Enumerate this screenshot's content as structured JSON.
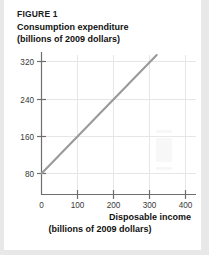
{
  "figure": {
    "label": "FIGURE 1",
    "title_line1": "Consumption expenditure",
    "title_line2": "(billions of 2009 dollars)",
    "xtitle_line1": "Disposable income",
    "xtitle_line2": "(billions of 2009 dollars)"
  },
  "colors": {
    "line": "#9a9a9a",
    "axis": "#6e6e6e",
    "grid": "#e3e3e3",
    "page": "#ffffff",
    "backdrop": "#e8e8e8",
    "text": "#111111"
  },
  "chart_data": {
    "type": "line",
    "title": "Consumption expenditure (billions of 2009 dollars)",
    "xlabel": "Disposable income (billions of 2009 dollars)",
    "ylabel": "Consumption expenditure (billions of 2009 dollars)",
    "xlim": [
      0,
      450
    ],
    "ylim": [
      0,
      360
    ],
    "xticks": [
      0,
      100,
      200,
      300,
      400
    ],
    "yticks": [
      80,
      160,
      240,
      320
    ],
    "xtick_labels": [
      "0",
      "100",
      "200",
      "300",
      "400"
    ],
    "ytick_labels": [
      "80",
      "160",
      "240",
      "320"
    ],
    "grid": true,
    "legend": "none",
    "series": [
      {
        "name": "Consumption function",
        "x": [
          0,
          320
        ],
        "y": [
          80,
          336
        ],
        "slope": 0.8,
        "intercept": 80,
        "color": "#9a9a9a"
      }
    ]
  }
}
